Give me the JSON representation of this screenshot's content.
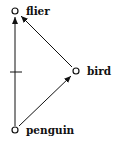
{
  "diagram": {
    "type": "inheritance-network",
    "nodes": [
      {
        "id": "flier",
        "label": "flier",
        "x": 15,
        "y": 11
      },
      {
        "id": "bird",
        "label": "bird",
        "x": 76,
        "y": 71
      },
      {
        "id": "penguin",
        "label": "penguin",
        "x": 15,
        "y": 130
      }
    ],
    "edges": [
      {
        "from": "penguin",
        "to": "bird",
        "polarity": "positive"
      },
      {
        "from": "bird",
        "to": "flier",
        "polarity": "positive"
      },
      {
        "from": "penguin",
        "to": "flier",
        "polarity": "negative"
      }
    ],
    "colors": {
      "ink": "#111111",
      "background": "#ffffff"
    }
  }
}
